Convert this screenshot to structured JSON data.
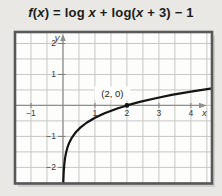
{
  "page": {
    "background": "#e9e8e4"
  },
  "figure": {
    "title": "f(x) = log x + log(x + 3) − 1",
    "title_parts": [
      {
        "text": "f",
        "italic": true
      },
      {
        "text": "(",
        "italic": false
      },
      {
        "text": "x",
        "italic": true
      },
      {
        "text": ") = log ",
        "italic": false
      },
      {
        "text": "x",
        "italic": true
      },
      {
        "text": " + log(",
        "italic": false
      },
      {
        "text": "x",
        "italic": true
      },
      {
        "text": " + 3) − 1",
        "italic": false
      }
    ],
    "point_label": "(2, 0)"
  },
  "chart_data": {
    "type": "line",
    "title": "f(x) = log x + log(x + 3) − 1",
    "xlabel": "x",
    "ylabel": "y",
    "xlim": [
      -1.5,
      4.66
    ],
    "ylim": [
      -2.52,
      2.37
    ],
    "grid": true,
    "grid_step": 0.5,
    "x_ticks": [
      -1,
      1,
      2,
      3,
      4
    ],
    "y_ticks": [
      2,
      1,
      -1,
      -2
    ],
    "legend": "none",
    "colors": {
      "curve": "#141414",
      "grid": "#c6c6c4",
      "axis": "#8f8f8d",
      "tick": "#7d7d7b",
      "text": "#3a3a3a",
      "box_fill": "#fdfdfb",
      "box_border": "#58585a",
      "shadow": "#d0cfca",
      "annotation_text": "#222222"
    },
    "annotations": [
      {
        "label": "(2, 0)",
        "x": 2,
        "y": 0,
        "marker": "dot"
      }
    ],
    "series": [
      {
        "name": "f(x) = log x + log(x + 3) − 1",
        "x": [
          0.01,
          0.013,
          0.018,
          0.025,
          0.035,
          0.05,
          0.07,
          0.1,
          0.14,
          0.2,
          0.28,
          0.4,
          0.55,
          0.75,
          1,
          1.3,
          1.7,
          2,
          2.4,
          2.9,
          3.4,
          4,
          4.66
        ],
        "y": [
          -2.521,
          -2.407,
          -2.265,
          -2.121,
          -1.974,
          -1.817,
          -1.668,
          -1.509,
          -1.357,
          -1.194,
          -1.037,
          -0.866,
          -0.709,
          -0.551,
          -0.398,
          -0.253,
          -0.097,
          0,
          0.113,
          0.233,
          0.338,
          0.447,
          0.553
        ]
      }
    ]
  }
}
